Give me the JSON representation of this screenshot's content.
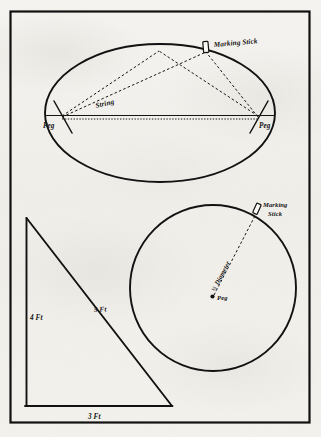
{
  "figure": {
    "background_color": "#f4f2ee",
    "ink_color": "#141414",
    "border": {
      "name": "outer-frame"
    },
    "ellipse_diagram": {
      "title_elements": [
        "Marking Stick",
        "String",
        "Peg",
        "Peg"
      ],
      "marking_stick_label": "Marking Stick",
      "string_label": "String",
      "peg_left_label": "Peg",
      "peg_right_label": "Peg",
      "shape": "ellipse",
      "description": "Ellipse drawn with two pegs and a loop of string guided by a marking stick"
    },
    "circle_diagram": {
      "marking_stick_label_line1": "Marking",
      "marking_stick_label_line2": "Stick",
      "radius_label_fraction": "½",
      "radius_label_text": "Diameter",
      "peg_label": "Peg",
      "shape": "circle",
      "description": "Circle drawn with a single center peg and a string of half-diameter length"
    },
    "triangle_diagram": {
      "vertical_leg_label": "4 Ft",
      "hypotenuse_label": "5 Ft",
      "base_label": "3 Ft",
      "shape": "right-triangle",
      "description": "3-4-5 right triangle used for squaring a corner"
    }
  }
}
